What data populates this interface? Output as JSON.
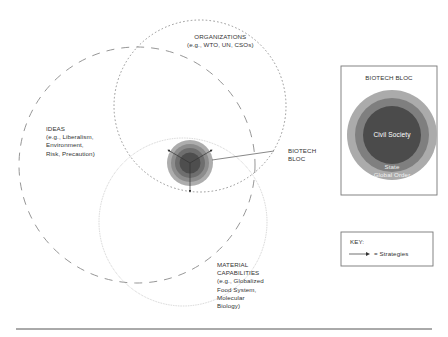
{
  "labels": {
    "organizations": [
      "ORGANIZATIONS",
      "(e.g., WTO, UN, CSOs)"
    ],
    "ideas": [
      "IDEAS",
      "(e.g., Liberalism,",
      "Environment,",
      "Risk, Precaution)"
    ],
    "biotech_bloc": [
      "BIOTECH",
      "BLOC"
    ],
    "material": [
      "MATERIAL",
      "CAPABILITIES",
      "(e.g., Globalized",
      "Food System,",
      "Molecular",
      "Biology)"
    ]
  },
  "inset": {
    "title": "BIOTECH BLOC",
    "rings": [
      {
        "label": "Global Order",
        "color": "#a9a9a9"
      },
      {
        "label": "State",
        "color": "#7d7d7d"
      },
      {
        "label": "Civil Society",
        "color": "#4a4a4a"
      }
    ]
  },
  "key": {
    "title": "KEY:",
    "item_label": "= Strategies",
    "item_icon": "arrow-right-icon"
  },
  "colors": {
    "line": "#8a8a8a",
    "ring_outer": "#a9a9a9",
    "ring_mid": "#8c8c8c",
    "ring_inner": "#6e6e6e",
    "ring_core": "#4a4a4a"
  }
}
